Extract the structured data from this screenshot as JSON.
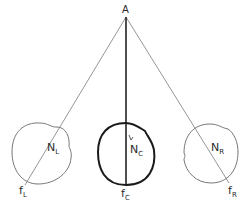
{
  "diagram": {
    "apex": {
      "label": "A"
    },
    "left": {
      "node": "N",
      "node_sub": "L",
      "foot": "f",
      "foot_sub": "L"
    },
    "center": {
      "node": "N",
      "node_sub": "C",
      "foot": "f",
      "foot_sub": "C"
    },
    "right": {
      "node": "N",
      "node_sub": "R",
      "foot": "f",
      "foot_sub": "R"
    }
  },
  "colors": {
    "line": "#8a8a8a",
    "bold": "#1a1a1a",
    "background": "#ffffff"
  }
}
